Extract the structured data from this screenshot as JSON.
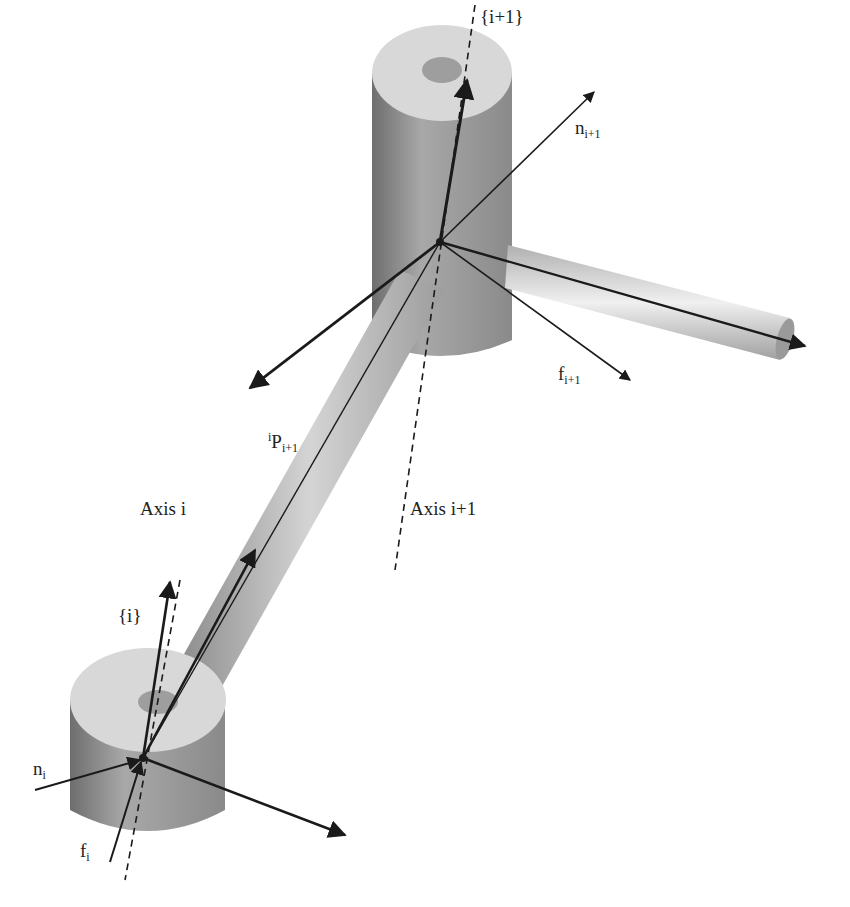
{
  "diagram": {
    "labels": {
      "frame_i_plus_1": "{i+1}",
      "torque_next": {
        "base": "n",
        "sub": "i+1"
      },
      "force_next": {
        "base": "f",
        "sub": "i+1"
      },
      "position_vector": {
        "sup": "i",
        "base": "P",
        "sub": "i+1"
      },
      "axis_i": "Axis i",
      "axis_i_plus_1": "Axis i+1",
      "frame_i": "{i}",
      "torque_i": {
        "base": "n",
        "sub": "i"
      },
      "force_i": {
        "base": "f",
        "sub": "i"
      }
    },
    "colors": {
      "cylinder_top": "#dcdcdc",
      "cylinder_side": "#9a9a9a",
      "link_rod": "#bdbdbd",
      "arrow": "#1a1a1a"
    }
  }
}
